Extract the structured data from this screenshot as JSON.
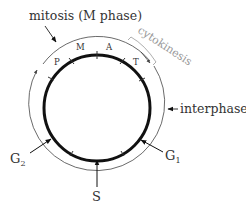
{
  "diagram": {
    "labels": {
      "mitosis": "mitosis (M phase)",
      "cytokinesis": "cytokinesis",
      "interphase": "interphase",
      "g1": "G",
      "g1_sub": "1",
      "g2": "G",
      "g2_sub": "2",
      "s": "S"
    },
    "mitosis_stages": [
      {
        "key": "prophase",
        "label": "P"
      },
      {
        "key": "metaphase",
        "label": "M"
      },
      {
        "key": "anaphase",
        "label": "A"
      },
      {
        "key": "telophase",
        "label": "T"
      }
    ],
    "colors": {
      "line": "#111111",
      "text": "#333333",
      "cytokinesis": "#999999"
    }
  }
}
